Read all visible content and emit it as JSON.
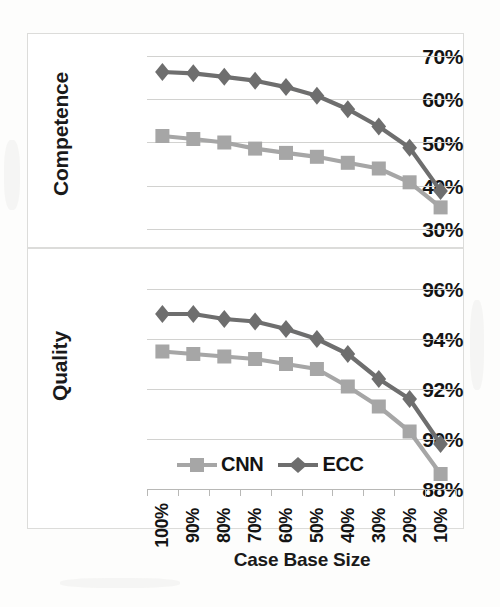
{
  "chart_data": [
    {
      "type": "line",
      "panel": "top",
      "title": "",
      "xlabel": "",
      "ylabel": "Competence",
      "categories": [
        "100%",
        "90%",
        "80%",
        "70%",
        "60%",
        "50%",
        "40%",
        "30%",
        "20%",
        "10%"
      ],
      "yticks": [
        "70%",
        "60%",
        "50%",
        "40%",
        "30%"
      ],
      "ytick_values": [
        70,
        60,
        50,
        40,
        30
      ],
      "ylim": [
        30,
        70
      ],
      "grid": true,
      "legend_position": "below-bottom-panel",
      "series": [
        {
          "name": "CNN",
          "marker": "square",
          "color": "#a6a6a6",
          "values": [
            51.5,
            50.8,
            50.0,
            48.6,
            47.6,
            46.7,
            45.3,
            44.0,
            40.8,
            35.0
          ]
        },
        {
          "name": "ECC",
          "marker": "diamond",
          "color": "#6e6e6e",
          "values": [
            66.3,
            66.0,
            65.2,
            64.3,
            62.8,
            60.8,
            57.7,
            53.7,
            48.8,
            38.8
          ]
        }
      ]
    },
    {
      "type": "line",
      "panel": "bottom",
      "title": "",
      "xlabel": "Case Base Size",
      "ylabel": "Quality",
      "categories": [
        "100%",
        "90%",
        "80%",
        "70%",
        "60%",
        "50%",
        "40%",
        "30%",
        "20%",
        "10%"
      ],
      "yticks": [
        "96%",
        "94%",
        "92%",
        "90%",
        "88%"
      ],
      "ytick_values": [
        96,
        94,
        92,
        90,
        88
      ],
      "ylim": [
        88,
        96
      ],
      "grid": true,
      "legend_position": "bottom-left",
      "series": [
        {
          "name": "CNN",
          "marker": "square",
          "color": "#a6a6a6",
          "values": [
            93.5,
            93.4,
            93.3,
            93.2,
            93.0,
            92.8,
            92.1,
            91.3,
            90.3,
            88.6
          ]
        },
        {
          "name": "ECC",
          "marker": "diamond",
          "color": "#6e6e6e",
          "values": [
            95.0,
            95.0,
            94.8,
            94.7,
            94.4,
            94.0,
            93.4,
            92.4,
            91.6,
            89.8
          ]
        }
      ]
    }
  ],
  "legend": {
    "items": [
      {
        "label": "CNN",
        "marker": "square",
        "color": "#a6a6a6"
      },
      {
        "label": "ECC",
        "marker": "diamond",
        "color": "#6e6e6e"
      }
    ]
  },
  "colors": {
    "cnn": "#a6a6a6",
    "ecc": "#6e6e6e",
    "gridline": "#d2d2d0",
    "axis": "#b8b8b6",
    "text": "#141414",
    "panel_background": "#ffffff",
    "page_background": "#fdfdfc"
  },
  "axis_titles": {
    "top_y": "Competence",
    "bottom_y": "Quality",
    "bottom_x": "Case Base Size"
  }
}
